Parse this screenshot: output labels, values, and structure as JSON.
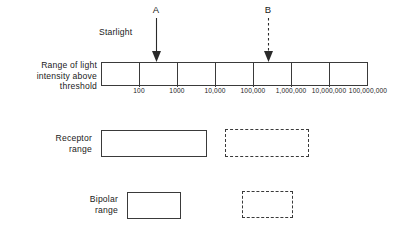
{
  "figure": {
    "title_alt": "Range of light intensity above threshold with receptor and bipolar ranges",
    "ink_color": "#3a3a3a",
    "text_color": "#1a1a1a",
    "background": "#ffffff"
  },
  "axis": {
    "label": "Range of light\nintensity above\nthreshold",
    "label_line1": "Range of light",
    "label_line2": "intensity  above",
    "label_line3": "threshold",
    "tick_labels": [
      "100",
      "1000",
      "10,000",
      "100,000",
      "1,000,000",
      "10,000,000",
      "100,000,000"
    ],
    "tick_positions_px": [
      139,
      177,
      215,
      253,
      291,
      329,
      368
    ],
    "bar_left_px": 101,
    "bar_right_px": 368,
    "segments": 7
  },
  "annotations": [
    {
      "name": "starlight",
      "label": "Starlight",
      "x_px": 99,
      "y_px": 28
    }
  ],
  "arrows": [
    {
      "name": "arrow-a",
      "letter": "A",
      "style": "solid",
      "x_px": 156,
      "letter_y_px": 6,
      "line_top_px": 20,
      "tip_y_px": 61
    },
    {
      "name": "arrow-b",
      "letter": "B",
      "style": "dashed",
      "x_px": 268,
      "letter_y_px": 6,
      "line_top_px": 20,
      "tip_y_px": 61
    }
  ],
  "rows": [
    {
      "name": "receptor-range",
      "label_line1": "Receptor",
      "label_line2": "range",
      "label_x_px": 92,
      "label_y_px": 133,
      "boxes": [
        {
          "name": "receptor-solid-box",
          "style": "solid",
          "x_px": 101,
          "y_px": 130,
          "w_px": 106,
          "h_px": 27
        },
        {
          "name": "receptor-dashed-box",
          "style": "dashed",
          "x_px": 225,
          "y_px": 129,
          "w_px": 84,
          "h_px": 28
        }
      ]
    },
    {
      "name": "bipolar-range",
      "label_line1": "Bipolar",
      "label_line2": "range",
      "label_x_px": 118,
      "label_y_px": 194,
      "boxes": [
        {
          "name": "bipolar-solid-box",
          "style": "solid",
          "x_px": 127,
          "y_px": 192,
          "w_px": 54,
          "h_px": 27
        },
        {
          "name": "bipolar-dashed-box",
          "style": "dashed",
          "x_px": 242,
          "y_px": 191,
          "w_px": 51,
          "h_px": 27
        }
      ]
    }
  ]
}
